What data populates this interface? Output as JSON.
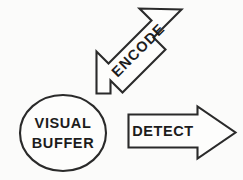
{
  "diagram": {
    "background_color": "#fbfbfa",
    "stroke_color": "#2a2a2a",
    "fill_color": "#fdfdfc",
    "text_color": "#1c1c1c",
    "nodes": [
      {
        "id": "visual-buffer",
        "shape": "ellipse",
        "line1": "VISUAL",
        "line2": "BUFFER",
        "center_x": 63,
        "center_y": 133,
        "radius_x": 43,
        "radius_y": 38
      }
    ],
    "arrows": [
      {
        "id": "encode",
        "label": "ENCODE",
        "direction": "down-left",
        "angle_degrees": -45,
        "text_rotation_degrees": -45
      },
      {
        "id": "detect",
        "label": "DETECT",
        "direction": "right",
        "angle_degrees": 0,
        "text_rotation_degrees": 0
      }
    ]
  }
}
